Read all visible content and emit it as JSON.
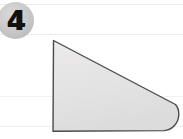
{
  "figure": {
    "badge": {
      "label": "4",
      "icon_name": "numbered-circle-badge",
      "circle_color": "#c9c9c9",
      "number_color": "#111111"
    },
    "shape": {
      "name": "rounded-wedge-polygon",
      "description": "Quadrilateral with vertical left side, diagonal top edge sloping down to the right, rounded right corner and horizontal bottom edge",
      "fill_color": "#e4e3e3",
      "stroke_color": "#4a4a4a",
      "stroke_width": 1.4,
      "path": "M 53.5 40.5 L 175.5 104.5 Q 179.0 108.5 178.8 114.5 Q 178.6 121.5 174.0 126.0 Q 170.0 130.2 164.0 130.6 L 53.0 131.2 Z",
      "vertices": [
        {
          "x": 53.5,
          "y": 40.5,
          "name": "top-left-vertex"
        },
        {
          "x": 175.5,
          "y": 104.5,
          "name": "upper-right-curve-start"
        },
        {
          "x": 164.0,
          "y": 130.6,
          "name": "lower-right-curve-end"
        },
        {
          "x": 53.0,
          "y": 131.2,
          "name": "bottom-left-vertex"
        }
      ]
    },
    "background": {
      "color": "#ffffff",
      "scan_lines": [
        {
          "y": 4,
          "left": 0,
          "width": 183,
          "faint": false
        },
        {
          "y": 34,
          "left": 0,
          "width": 183,
          "faint": false
        },
        {
          "y": 96,
          "left": 0,
          "width": 183,
          "faint": true
        },
        {
          "y": 126,
          "left": 0,
          "width": 183,
          "faint": true
        }
      ]
    }
  }
}
